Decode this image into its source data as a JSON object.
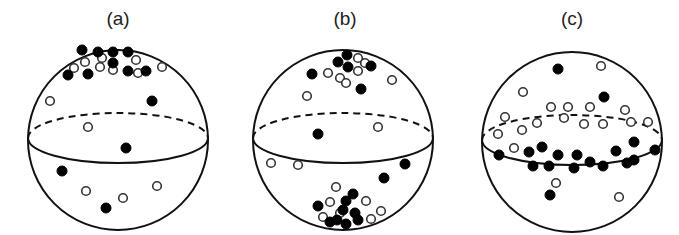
{
  "figure": {
    "panels": [
      {
        "label": "(a)",
        "description": "Particles clustered near north pole of sphere",
        "center": [
          118,
          140
        ],
        "radius": 90,
        "label_pos": [
          118,
          25
        ],
        "filled": [
          [
            82,
            50
          ],
          [
            98,
            52
          ],
          [
            113,
            52
          ],
          [
            128,
            52
          ],
          [
            113,
            63
          ],
          [
            68,
            75
          ],
          [
            88,
            74
          ],
          [
            128,
            71
          ],
          [
            146,
            71
          ],
          [
            152,
            101
          ],
          [
            126,
            148
          ],
          [
            62,
            171
          ],
          [
            106,
            208
          ]
        ],
        "open": [
          [
            74,
            68
          ],
          [
            85,
            62
          ],
          [
            100,
            67
          ],
          [
            113,
            70
          ],
          [
            102,
            58
          ],
          [
            136,
            60
          ],
          [
            138,
            73
          ],
          [
            162,
            67
          ],
          [
            50,
            101
          ],
          [
            88,
            127
          ],
          [
            86,
            191
          ],
          [
            123,
            198
          ],
          [
            157,
            186
          ]
        ]
      },
      {
        "label": "(b)",
        "description": "Particles clustered at both poles",
        "center": [
          343,
          140
        ],
        "radius": 90,
        "label_pos": [
          345,
          25
        ],
        "filled": [
          [
            347,
            55
          ],
          [
            338,
            62
          ],
          [
            348,
            67
          ],
          [
            371,
            66
          ],
          [
            312,
            74
          ],
          [
            361,
            89
          ],
          [
            318,
            134
          ],
          [
            405,
            164
          ],
          [
            384,
            178
          ],
          [
            353,
            194
          ],
          [
            346,
            201
          ],
          [
            318,
            206
          ],
          [
            343,
            210
          ],
          [
            355,
            213
          ],
          [
            337,
            220
          ],
          [
            358,
            220
          ],
          [
            330,
            222
          ],
          [
            346,
            224
          ]
        ],
        "open": [
          [
            358,
            58
          ],
          [
            365,
            63
          ],
          [
            328,
            73
          ],
          [
            340,
            78
          ],
          [
            358,
            71
          ],
          [
            346,
            83
          ],
          [
            392,
            80
          ],
          [
            307,
            96
          ],
          [
            378,
            127
          ],
          [
            271,
            163
          ],
          [
            298,
            165
          ],
          [
            336,
            187
          ],
          [
            330,
            202
          ],
          [
            366,
            201
          ],
          [
            340,
            213
          ],
          [
            381,
            211
          ],
          [
            323,
            217
          ],
          [
            371,
            219
          ]
        ]
      },
      {
        "label": "(c)",
        "description": "Particles distributed around equator band",
        "center": [
          572,
          142
        ],
        "radius": 90,
        "label_pos": [
          572,
          25
        ],
        "filled": [
          [
            558,
            69
          ],
          [
            604,
            97
          ],
          [
            634,
            142
          ],
          [
            499,
            155
          ],
          [
            529,
            152
          ],
          [
            542,
            147
          ],
          [
            558,
            155
          ],
          [
            577,
            155
          ],
          [
            590,
            162
          ],
          [
            616,
            151
          ],
          [
            634,
            160
          ],
          [
            655,
            150
          ],
          [
            533,
            166
          ],
          [
            549,
            166
          ],
          [
            574,
            168
          ],
          [
            603,
            166
          ],
          [
            627,
            163
          ],
          [
            550,
            195
          ]
        ],
        "open": [
          [
            601,
            66
          ],
          [
            523,
            92
          ],
          [
            551,
            107
          ],
          [
            568,
            107
          ],
          [
            590,
            107
          ],
          [
            625,
            110
          ],
          [
            505,
            117
          ],
          [
            537,
            123
          ],
          [
            564,
            118
          ],
          [
            584,
            124
          ],
          [
            603,
            124
          ],
          [
            631,
            122
          ],
          [
            648,
            122
          ],
          [
            498,
            134
          ],
          [
            522,
            130
          ],
          [
            514,
            148
          ],
          [
            556,
            183
          ],
          [
            619,
            197
          ]
        ]
      }
    ],
    "legend": {
      "filled_marker": "filled circle",
      "open_marker": "open circle"
    }
  }
}
